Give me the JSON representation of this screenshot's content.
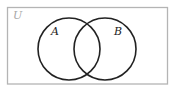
{
  "diagram": {
    "type": "venn",
    "universe": {
      "label": "U",
      "stroke": "#b4b4b4",
      "label_color": "#a8a8a8"
    },
    "sets": [
      {
        "label": "A",
        "stroke": "#222222"
      },
      {
        "label": "B",
        "stroke": "#222222"
      }
    ]
  }
}
